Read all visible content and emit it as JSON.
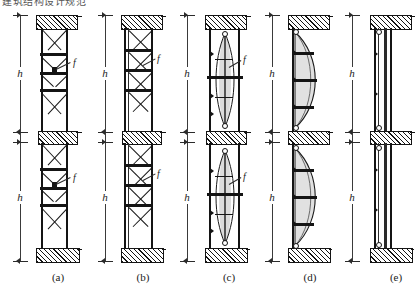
{
  "header": {
    "cut_off_text": "建筑结构设计规范",
    "note": "partially cropped line of text at top edge"
  },
  "figure": {
    "caption_prefix": "(",
    "caption_suffix": ")",
    "story_height_symbol": "h",
    "brace_symbol": "f",
    "panels": [
      {
        "id": "a",
        "label": "a",
        "caption": "(a)",
        "h_upper": "h",
        "h_lower": "h",
        "f_upper": "f",
        "f_lower": "f",
        "bracing_type": "double-X lattice with batten plates",
        "stories": 2
      },
      {
        "id": "b",
        "label": "b",
        "caption": "(b)",
        "h_upper": "h",
        "h_lower": "h",
        "f_upper": "f",
        "f_lower": "f",
        "bracing_type": "stacked X-bracing panels",
        "stories": 2
      },
      {
        "id": "c",
        "label": "c",
        "caption": "(c)",
        "h_upper": "h",
        "h_lower": "h",
        "f_upper": "f",
        "f_lower": "f",
        "bracing_type": "lens-shaped pretensioned tie",
        "stories": 2
      },
      {
        "id": "d",
        "label": "d",
        "caption": "(d)",
        "h_upper": "h",
        "h_lower": "h",
        "f_upper": "",
        "f_lower": "",
        "bracing_type": "single bowed cable with struts",
        "stories": 2
      },
      {
        "id": "e",
        "label": "e",
        "caption": "(e)",
        "h_upper": "h",
        "h_lower": "h",
        "f_upper": "",
        "f_lower": "",
        "bracing_type": "straight unbraced vertical chords",
        "stories": 2
      }
    ]
  },
  "colors": {
    "ink": "#141414",
    "line": "#2b2b2b",
    "shade": "#bdbdbd",
    "paper": "#ffffff"
  }
}
